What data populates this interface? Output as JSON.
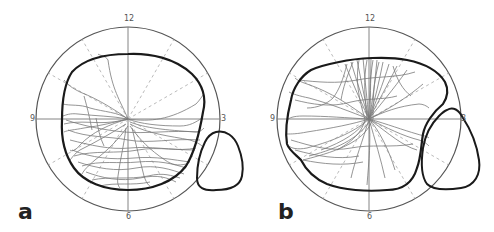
{
  "figure": {
    "panels": [
      {
        "id": "a",
        "label": "a",
        "center": [
          128,
          119
        ],
        "radius": 92,
        "clock_labels": {
          "top": "12",
          "right": "3",
          "bottom": "6",
          "left": "9"
        },
        "description": "Polar perimetry plot with thick visual-field boundary, scanpath traces concentrated in lower hemifield, and blind-spot outline at ~4 o'clock outside the main field"
      },
      {
        "id": "b",
        "label": "b",
        "center": [
          369,
          119
        ],
        "radius": 92,
        "clock_labels": {
          "top": "12",
          "right": "3",
          "bottom": "6",
          "left": "9"
        },
        "description": "Polar perimetry plot with thick visual-field boundary indented on the right by an enlarged blind-spot outline, scanpath traces concentrated vertically through center and spreading to lower-left"
      }
    ],
    "colors": {
      "circle": "#555555",
      "axis": "#777777",
      "dashed_radial": "#aaaaaa",
      "boundary": "#1a1a1a",
      "traces": "#7a7a7a",
      "label": "#222222"
    }
  }
}
